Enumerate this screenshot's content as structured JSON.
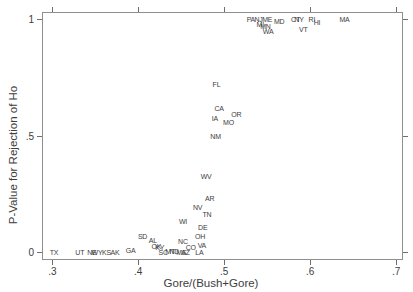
{
  "colors": {
    "background": "#ffffff",
    "text": "#3d3d3d",
    "frame": "#8f8f8f",
    "tick": "#6f6f6f"
  },
  "chart_data": {
    "type": "scatter",
    "title": "",
    "marker_style": "state-abbreviation-text-labels",
    "xlabel": "Gore/(Bush+Gore)",
    "ylabel": "P-Value for Rejection of Ho",
    "xlim": [
      0.288,
      0.708
    ],
    "ylim": [
      -0.034,
      1.03
    ],
    "grid": false,
    "legend": "none",
    "x_ticks": [
      0.3,
      0.4,
      0.5,
      0.6,
      0.7
    ],
    "x_tick_labels": [
      ".3",
      ".4",
      ".5",
      ".6",
      ".7"
    ],
    "y_ticks": [
      0,
      0.5,
      1
    ],
    "y_tick_labels": [
      "0",
      ".5",
      "1"
    ],
    "tick_sides": "all-four-mirrored",
    "points": [
      {
        "label": "TX",
        "x": 0.302,
        "y": 0
      },
      {
        "label": "UT",
        "x": 0.332,
        "y": 0
      },
      {
        "label": "NE",
        "x": 0.346,
        "y": 0.002
      },
      {
        "label": "WY",
        "x": 0.352,
        "y": 0
      },
      {
        "label": "KS",
        "x": 0.363,
        "y": 0.002
      },
      {
        "label": "AK",
        "x": 0.373,
        "y": 0.002
      },
      {
        "label": "GA",
        "x": 0.391,
        "y": 0.011
      },
      {
        "label": "SD",
        "x": 0.405,
        "y": 0.07
      },
      {
        "label": "AL",
        "x": 0.417,
        "y": 0.052
      },
      {
        "label": "OK",
        "x": 0.421,
        "y": 0.028
      },
      {
        "label": "KY",
        "x": 0.425,
        "y": 0.022
      },
      {
        "label": "SC",
        "x": 0.429,
        "y": 0
      },
      {
        "label": "MT",
        "x": 0.437,
        "y": 0.004
      },
      {
        "label": "ND",
        "x": 0.442,
        "y": 0.004
      },
      {
        "label": "MS",
        "x": 0.45,
        "y": 0
      },
      {
        "label": "AZ",
        "x": 0.455,
        "y": 0.002
      },
      {
        "label": "NC",
        "x": 0.452,
        "y": 0.047
      },
      {
        "label": "WI",
        "x": 0.452,
        "y": 0.135
      },
      {
        "label": "CO",
        "x": 0.461,
        "y": 0.021
      },
      {
        "label": "LA",
        "x": 0.471,
        "y": 0
      },
      {
        "label": "VA",
        "x": 0.474,
        "y": 0.03
      },
      {
        "label": "OH",
        "x": 0.472,
        "y": 0.071
      },
      {
        "label": "DE",
        "x": 0.475,
        "y": 0.107
      },
      {
        "label": "NV",
        "x": 0.469,
        "y": 0.193
      },
      {
        "label": "TN",
        "x": 0.48,
        "y": 0.165
      },
      {
        "label": "AR",
        "x": 0.483,
        "y": 0.23
      },
      {
        "label": "WV",
        "x": 0.479,
        "y": 0.328
      },
      {
        "label": "NM",
        "x": 0.49,
        "y": 0.498
      },
      {
        "label": "IA",
        "x": 0.489,
        "y": 0.575
      },
      {
        "label": "MO",
        "x": 0.505,
        "y": 0.56
      },
      {
        "label": "CA",
        "x": 0.494,
        "y": 0.618
      },
      {
        "label": "OR",
        "x": 0.514,
        "y": 0.592
      },
      {
        "label": "FL",
        "x": 0.491,
        "y": 0.719
      },
      {
        "label": "PA",
        "x": 0.531,
        "y": 1
      },
      {
        "label": "NJ",
        "x": 0.54,
        "y": 1
      },
      {
        "label": "ME",
        "x": 0.55,
        "y": 1
      },
      {
        "label": "MI",
        "x": 0.542,
        "y": 0.98
      },
      {
        "label": "MN",
        "x": 0.548,
        "y": 0.97
      },
      {
        "label": "WA",
        "x": 0.551,
        "y": 0.95
      },
      {
        "label": "MD",
        "x": 0.564,
        "y": 0.99
      },
      {
        "label": "CT",
        "x": 0.583,
        "y": 1
      },
      {
        "label": "NY",
        "x": 0.587,
        "y": 1
      },
      {
        "label": "VT",
        "x": 0.592,
        "y": 0.957
      },
      {
        "label": "RI",
        "x": 0.602,
        "y": 1
      },
      {
        "label": "HI",
        "x": 0.608,
        "y": 0.985
      },
      {
        "label": "MA",
        "x": 0.64,
        "y": 1
      }
    ]
  }
}
